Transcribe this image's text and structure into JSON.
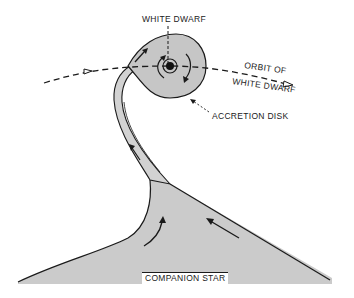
{
  "diagram": {
    "type": "astronomy-schematic",
    "labels": {
      "white_dwarf": "WHITE DWARF",
      "orbit_line1": "ORBIT OF",
      "orbit_line2": "WHITE DWARF",
      "accretion_disk": "ACCRETION DISK",
      "companion_star": "COMPANION STAR"
    },
    "elements": [
      {
        "id": "white-dwarf",
        "shape": "dark dot at disk center"
      },
      {
        "id": "accretion-disk",
        "shape": "grey teardrop disk around white dwarf"
      },
      {
        "id": "orbit-path",
        "shape": "dashed arc with open arrowheads, left to right"
      },
      {
        "id": "gas-stream",
        "shape": "narrow grey stream from companion star to disk"
      },
      {
        "id": "companion-star",
        "shape": "large grey lobe at bottom"
      },
      {
        "id": "flow-arrows",
        "shape": "arrows showing gas flow up stream and rotation in disk"
      }
    ],
    "colors": {
      "fill_grey": "#c9c9c9",
      "line": "#1a1a1a",
      "background": "#ffffff"
    }
  }
}
